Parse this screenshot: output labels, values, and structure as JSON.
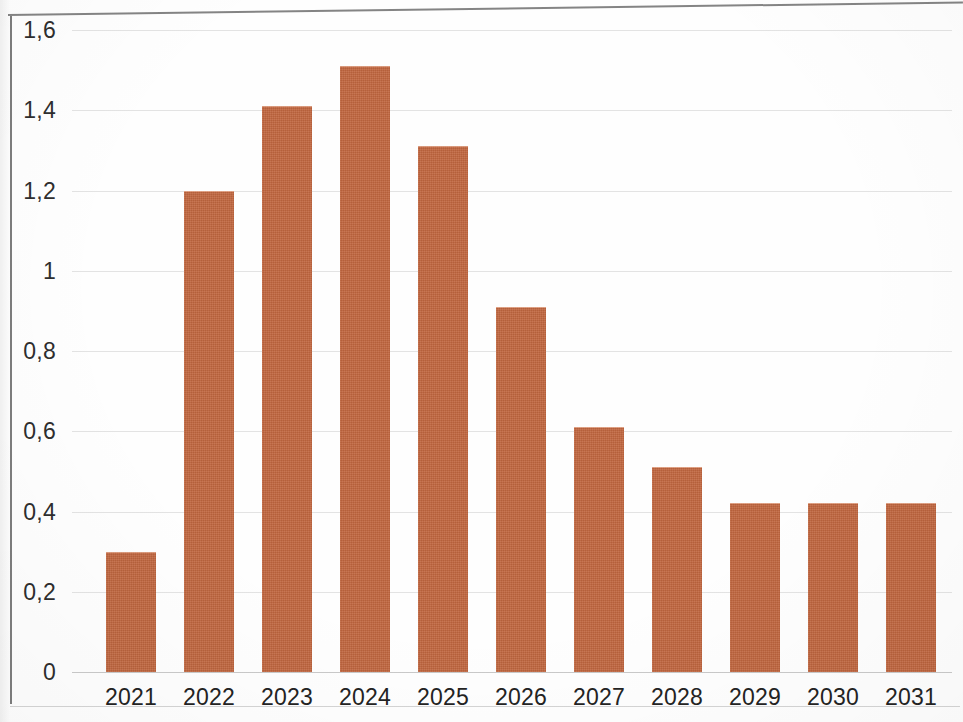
{
  "chart_data": {
    "type": "bar",
    "title": "",
    "subtitle": "",
    "xlabel": "",
    "ylabel": "",
    "categories": [
      "2021",
      "2022",
      "2023",
      "2024",
      "2025",
      "2026",
      "2027",
      "2028",
      "2029",
      "2030",
      "2031"
    ],
    "values": [
      0.3,
      1.2,
      1.41,
      1.51,
      1.31,
      0.91,
      0.61,
      0.51,
      0.42,
      0.42,
      0.42
    ],
    "ylim": [
      0,
      1.6
    ],
    "y_tick_values": [
      0,
      0.2,
      0.4,
      0.6,
      0.8,
      1.0,
      1.2,
      1.4,
      1.6
    ],
    "y_tick_labels": [
      "0",
      "0,2",
      "0,4",
      "0,6",
      "0,8",
      "1",
      "1,2",
      "1,4",
      "1,6"
    ],
    "decimal_separator": ",",
    "grid": true,
    "grid_axis": "y",
    "legend": false,
    "legend_position": "none",
    "series": [
      {
        "name": "",
        "values": [
          0.3,
          1.2,
          1.41,
          1.51,
          1.31,
          0.91,
          0.61,
          0.51,
          0.42,
          0.42,
          0.42
        ]
      }
    ],
    "colors": {
      "bar_fill": "#c1663f",
      "gridline": "#dadada",
      "axis_line": "#6f6f6f",
      "tick_label": "#2e2e2e",
      "background": "#fefefe"
    }
  }
}
